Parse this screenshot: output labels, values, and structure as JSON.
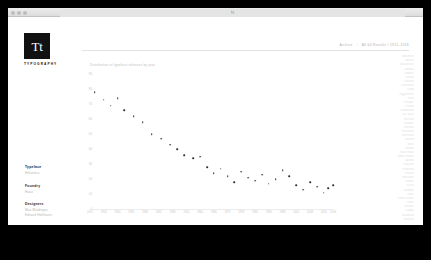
{
  "window": {
    "tab_title": "Tt",
    "traffic_lights": [
      "close-light",
      "minimize-light",
      "zoom-light"
    ]
  },
  "brand": {
    "mark": "Tt",
    "wordmark": "TYPOGRAPHY"
  },
  "header": {
    "meta_left": "Archive",
    "separator": "/",
    "meta_right": "All 64 Results / 1912–2018"
  },
  "sidebar": {
    "groups": [
      {
        "title": "Typeface",
        "options": [
          "Helvetica"
        ]
      },
      {
        "title": "Foundry",
        "options": [
          "Haas"
        ]
      },
      {
        "title": "Designers",
        "options": [
          "Max Miedinger",
          "Eduard Hoffmann"
        ]
      },
      {
        "title": "Date",
        "options": [
          "1957"
        ]
      }
    ]
  },
  "chart_data": {
    "type": "scatter",
    "title": "",
    "caption": "Distribution of typeface releases by year",
    "xlabel": "",
    "ylabel": "",
    "xlim": [
      1912,
      2018
    ],
    "ylim": [
      0,
      90
    ],
    "grid": false,
    "legend": false,
    "yticks": [
      90,
      80,
      70,
      60,
      50,
      40,
      30,
      20,
      10,
      0
    ],
    "ytick_labels": [
      "90",
      "80",
      "70",
      "60",
      "50",
      "40",
      "30",
      "20",
      "10",
      "0"
    ],
    "xticks": [
      1912,
      1918,
      1924,
      1930,
      1936,
      1942,
      1948,
      1954,
      1960,
      1966,
      1972,
      1978,
      1984,
      1990,
      1996,
      2002,
      2008,
      2014,
      2018
    ],
    "xtick_labels": [
      "1912",
      "1918",
      "1924",
      "1930",
      "1936",
      "1942",
      "1948",
      "1954",
      "1960",
      "1966",
      "1972",
      "1978",
      "1984",
      "1990",
      "1996",
      "2002",
      "2008",
      "2014",
      "2018"
    ],
    "points": [
      {
        "x": 1914,
        "y": 78
      },
      {
        "x": 1918,
        "y": 73
      },
      {
        "x": 1921,
        "y": 69
      },
      {
        "x": 1924,
        "y": 74
      },
      {
        "x": 1927,
        "y": 66
      },
      {
        "x": 1931,
        "y": 62
      },
      {
        "x": 1935,
        "y": 58
      },
      {
        "x": 1939,
        "y": 50
      },
      {
        "x": 1943,
        "y": 47
      },
      {
        "x": 1947,
        "y": 43
      },
      {
        "x": 1950,
        "y": 40
      },
      {
        "x": 1953,
        "y": 36
      },
      {
        "x": 1957,
        "y": 34
      },
      {
        "x": 1960,
        "y": 35
      },
      {
        "x": 1963,
        "y": 28
      },
      {
        "x": 1966,
        "y": 24
      },
      {
        "x": 1969,
        "y": 27
      },
      {
        "x": 1972,
        "y": 22
      },
      {
        "x": 1975,
        "y": 18
      },
      {
        "x": 1978,
        "y": 25
      },
      {
        "x": 1981,
        "y": 21
      },
      {
        "x": 1984,
        "y": 19
      },
      {
        "x": 1987,
        "y": 23
      },
      {
        "x": 1990,
        "y": 17
      },
      {
        "x": 1993,
        "y": 20
      },
      {
        "x": 1996,
        "y": 26
      },
      {
        "x": 1999,
        "y": 22
      },
      {
        "x": 2002,
        "y": 16
      },
      {
        "x": 2005,
        "y": 13
      },
      {
        "x": 2008,
        "y": 18
      },
      {
        "x": 2011,
        "y": 15
      },
      {
        "x": 2014,
        "y": 11
      },
      {
        "x": 2016,
        "y": 14
      },
      {
        "x": 2018,
        "y": 16
      }
    ]
  },
  "index_list": {
    "items": [
      "Akzidenz",
      "Avenir",
      "Baskerville",
      "Bembo",
      "Bodoni",
      "Caslon",
      "Centaur",
      "Clarendon",
      "Didot",
      "Egyptienne",
      "Folio",
      "Frutiger",
      "Futura",
      "Garamond",
      "Gill Sans",
      "Gotham",
      "Granjon",
      "Grotesk",
      "Helvetica",
      "Interstate",
      "Jenson",
      "Meta",
      "Minion",
      "Neue Haas",
      "News Gothic",
      "Optima",
      "Palatino",
      "Perpetua",
      "Plantin",
      "Rockwell",
      "Sabon",
      "Scala",
      "Stempel",
      "Times",
      "Trade Gothic",
      "Trajan",
      "Univers",
      "Utopia",
      "Walbaum",
      "Windsor"
    ]
  }
}
